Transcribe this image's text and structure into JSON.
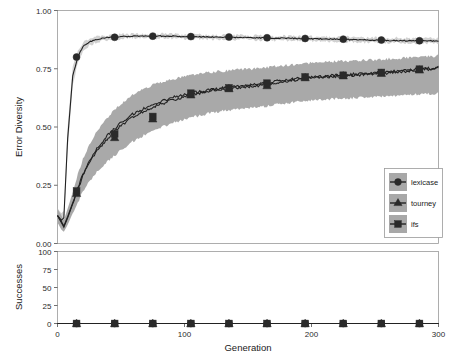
{
  "chart_data": {
    "type": "line",
    "title": "",
    "panels": [
      {
        "id": "error-diversity",
        "ylabel": "Error Diversity",
        "xlabel": "",
        "ylim": [
          0.0,
          1.0
        ],
        "xlim": [
          0,
          300
        ],
        "yticks": [
          0.0,
          0.25,
          0.5,
          0.75,
          1.0
        ],
        "ytick_labels": [
          "0.00",
          "0.25",
          "0.50",
          "0.75",
          "1.00"
        ],
        "xticks": [
          0,
          100,
          200,
          300
        ],
        "xtick_labels": [
          "0",
          "100",
          "200",
          "300"
        ],
        "grid": false,
        "series": [
          {
            "name": "lexicase",
            "marker": "circle",
            "x": [
              0,
              3,
              5,
              8,
              12,
              16,
              20,
              25,
              30,
              40,
              50,
              60,
              75,
              90,
              105,
              120,
              135,
              150,
              165,
              180,
              195,
              210,
              225,
              240,
              255,
              270,
              285,
              300
            ],
            "values": [
              0.12,
              0.1,
              0.11,
              0.45,
              0.72,
              0.8,
              0.845,
              0.865,
              0.875,
              0.885,
              0.888,
              0.89,
              0.89,
              0.89,
              0.888,
              0.886,
              0.885,
              0.884,
              0.882,
              0.881,
              0.879,
              0.878,
              0.876,
              0.874,
              0.872,
              0.871,
              0.87,
              0.869
            ],
            "band_low": [
              0.09,
              0.07,
              0.08,
              0.4,
              0.68,
              0.775,
              0.825,
              0.85,
              0.862,
              0.874,
              0.878,
              0.881,
              0.881,
              0.881,
              0.879,
              0.877,
              0.876,
              0.874,
              0.872,
              0.871,
              0.869,
              0.867,
              0.865,
              0.863,
              0.861,
              0.86,
              0.859,
              0.858
            ],
            "band_high": [
              0.15,
              0.13,
              0.14,
              0.5,
              0.76,
              0.825,
              0.862,
              0.878,
              0.886,
              0.895,
              0.898,
              0.899,
              0.899,
              0.899,
              0.897,
              0.895,
              0.894,
              0.893,
              0.891,
              0.89,
              0.888,
              0.887,
              0.886,
              0.884,
              0.883,
              0.882,
              0.881,
              0.88
            ],
            "marker_x": [
              15,
              45,
              75,
              105,
              135,
              165,
              195,
              225,
              255,
              285
            ],
            "marker_y": [
              0.8,
              0.885,
              0.89,
              0.888,
              0.886,
              0.883,
              0.88,
              0.877,
              0.873,
              0.87
            ]
          },
          {
            "name": "tourney",
            "marker": "triangle",
            "x": [
              0,
              3,
              5,
              8,
              12,
              16,
              20,
              25,
              30,
              40,
              50,
              60,
              75,
              90,
              105,
              120,
              135,
              150,
              165,
              180,
              195,
              210,
              225,
              240,
              255,
              270,
              285,
              300
            ],
            "values": [
              0.12,
              0.09,
              0.07,
              0.11,
              0.17,
              0.23,
              0.29,
              0.345,
              0.39,
              0.455,
              0.505,
              0.545,
              0.585,
              0.615,
              0.638,
              0.655,
              0.665,
              0.672,
              0.682,
              0.695,
              0.708,
              0.715,
              0.72,
              0.725,
              0.73,
              0.737,
              0.745,
              0.752
            ],
            "band_low": [
              0.09,
              0.06,
              0.05,
              0.08,
              0.13,
              0.175,
              0.225,
              0.265,
              0.3,
              0.355,
              0.4,
              0.44,
              0.485,
              0.515,
              0.54,
              0.56,
              0.572,
              0.58,
              0.59,
              0.602,
              0.612,
              0.618,
              0.622,
              0.626,
              0.63,
              0.635,
              0.64,
              0.645
            ],
            "band_high": [
              0.15,
              0.12,
              0.1,
              0.15,
              0.22,
              0.295,
              0.36,
              0.42,
              0.47,
              0.545,
              0.6,
              0.64,
              0.68,
              0.705,
              0.722,
              0.735,
              0.742,
              0.748,
              0.755,
              0.765,
              0.772,
              0.778,
              0.782,
              0.786,
              0.79,
              0.795,
              0.8,
              0.805
            ],
            "marker_x": [
              15,
              45,
              75,
              105,
              135,
              165,
              195,
              225,
              255,
              285
            ],
            "marker_y": [
              0.215,
              0.455,
              0.535,
              0.638,
              0.665,
              0.678,
              0.712,
              0.72,
              0.731,
              0.745
            ]
          },
          {
            "name": "ifs",
            "marker": "square",
            "x": [
              0,
              3,
              5,
              8,
              12,
              16,
              20,
              25,
              30,
              40,
              50,
              60,
              75,
              90,
              105,
              120,
              135,
              150,
              165,
              180,
              195,
              210,
              225,
              240,
              255,
              270,
              285,
              300
            ],
            "values": [
              0.12,
              0.095,
              0.075,
              0.115,
              0.175,
              0.238,
              0.298,
              0.352,
              0.398,
              0.468,
              0.518,
              0.558,
              0.596,
              0.625,
              0.645,
              0.66,
              0.67,
              0.678,
              0.69,
              0.702,
              0.712,
              0.718,
              0.723,
              0.728,
              0.734,
              0.741,
              0.748,
              0.756
            ],
            "marker_x": [
              15,
              45,
              75,
              105,
              135,
              165,
              195,
              225,
              255,
              285
            ],
            "marker_y": [
              0.225,
              0.47,
              0.545,
              0.645,
              0.668,
              0.688,
              0.715,
              0.722,
              0.734,
              0.748
            ]
          }
        ]
      },
      {
        "id": "successes",
        "ylabel": "Successes",
        "xlabel": "Generation",
        "ylim": [
          0,
          100
        ],
        "xlim": [
          0,
          300
        ],
        "yticks": [
          0,
          25,
          50,
          75,
          100
        ],
        "ytick_labels": [
          "0",
          "25",
          "50",
          "75",
          "100"
        ],
        "xticks": [
          0,
          100,
          200,
          300
        ],
        "xtick_labels": [
          "0",
          "100",
          "200",
          "300"
        ],
        "grid": false,
        "series": [
          {
            "name": "lexicase",
            "marker": "circle",
            "x": [
              0,
              300
            ],
            "values": [
              0,
              0
            ],
            "marker_x": [
              15,
              45,
              75,
              105,
              135,
              165,
              195,
              225,
              255,
              285
            ],
            "marker_y": [
              0,
              0,
              0,
              0,
              0,
              0,
              0,
              0,
              0,
              0
            ]
          },
          {
            "name": "tourney",
            "marker": "triangle",
            "x": [
              0,
              300
            ],
            "values": [
              0,
              0
            ],
            "marker_x": [
              15,
              45,
              75,
              105,
              135,
              165,
              195,
              225,
              255,
              285
            ],
            "marker_y": [
              0,
              0,
              0,
              0,
              0,
              0,
              0,
              0,
              0,
              0
            ]
          },
          {
            "name": "ifs",
            "marker": "square",
            "x": [
              0,
              300
            ],
            "values": [
              0,
              0
            ],
            "marker_x": [
              15,
              45,
              75,
              105,
              135,
              165,
              195,
              225,
              255,
              285
            ],
            "marker_y": [
              0,
              0,
              0,
              0,
              0,
              0,
              0,
              0,
              0,
              0
            ]
          }
        ]
      }
    ],
    "legend": {
      "position": "center-right",
      "entries": [
        {
          "label": "lexicase",
          "marker": "circle"
        },
        {
          "label": "tourney",
          "marker": "triangle"
        },
        {
          "label": "ifs",
          "marker": "square"
        }
      ]
    },
    "colors": {
      "line": "#222222",
      "band": "#a4a4a4",
      "band_light": "#c9c9c9",
      "frame": "#9a9a9a",
      "text": "#1a1a1a",
      "legend_key_bg": "#a8a8a8"
    }
  },
  "axes": {
    "top_ylabel": "Error Diversity",
    "bottom_ylabel": "Successes",
    "xlabel": "Generation",
    "top_yticks": [
      "0.00",
      "0.25",
      "0.50",
      "0.75",
      "1.00"
    ],
    "bottom_yticks": [
      "0",
      "25",
      "50",
      "75",
      "100"
    ],
    "xticks": [
      "0",
      "100",
      "200",
      "300"
    ]
  },
  "legend": {
    "items": [
      {
        "label": "lexicase"
      },
      {
        "label": "tourney"
      },
      {
        "label": "ifs"
      }
    ]
  }
}
